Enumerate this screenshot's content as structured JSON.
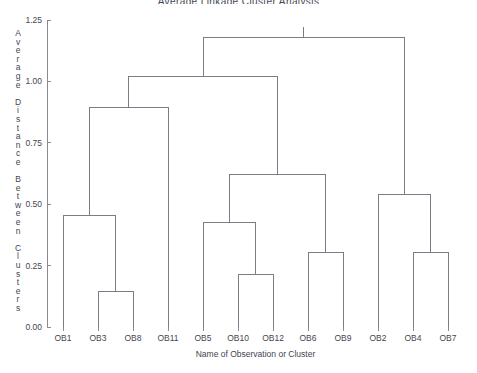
{
  "chart_data": {
    "type": "dendrogram",
    "title": "Average Linkage Cluster Analysis",
    "xlabel": "Name of Observation or Cluster",
    "ylabel": "Average Distance Between Clusters",
    "ylim": [
      0.0,
      1.25
    ],
    "grid": false,
    "legend": null,
    "ytick_labels": [
      "1.25",
      "1.00",
      "0.75",
      "0.50",
      "0.25",
      "0.00"
    ],
    "ytick_values": [
      1.25,
      1.0,
      0.75,
      0.5,
      0.25,
      0.0
    ],
    "leaves": [
      "OB1",
      "OB3",
      "OB8",
      "OB11",
      "OB5",
      "OB10",
      "OB12",
      "OB6",
      "OB9",
      "OB2",
      "OB4",
      "OB7"
    ],
    "leaf_positions": [
      1,
      2,
      3,
      4,
      5,
      6,
      7,
      8,
      9,
      10,
      11,
      12
    ],
    "merges": [
      {
        "id": "m1",
        "left": "OB3",
        "right": "OB8",
        "height": 0.145
      },
      {
        "id": "m2",
        "left": "OB1",
        "right": "m1",
        "height": 0.455
      },
      {
        "id": "m3",
        "left": "OB10",
        "right": "OB12",
        "height": 0.215
      },
      {
        "id": "m4",
        "left": "OB5",
        "right": "m3",
        "height": 0.425
      },
      {
        "id": "m5",
        "left": "OB6",
        "right": "OB9",
        "height": 0.305
      },
      {
        "id": "m6",
        "left": "OB4",
        "right": "OB7",
        "height": 0.305
      },
      {
        "id": "m7",
        "left": "OB2",
        "right": "m6",
        "height": 0.54
      },
      {
        "id": "m8",
        "left": "m4",
        "right": "m5",
        "height": 0.62
      },
      {
        "id": "m9",
        "left": "m2",
        "right": "OB11",
        "height": 0.895
      },
      {
        "id": "m10",
        "left": "m9",
        "right": "m8",
        "height": 1.02
      },
      {
        "id": "m11",
        "left": "m10",
        "right": "m7",
        "height": 1.18
      }
    ],
    "colors": {
      "line": "#7c7c86",
      "axis": "#8a8a93",
      "text": "#45454f",
      "background": "#ffffff"
    }
  }
}
